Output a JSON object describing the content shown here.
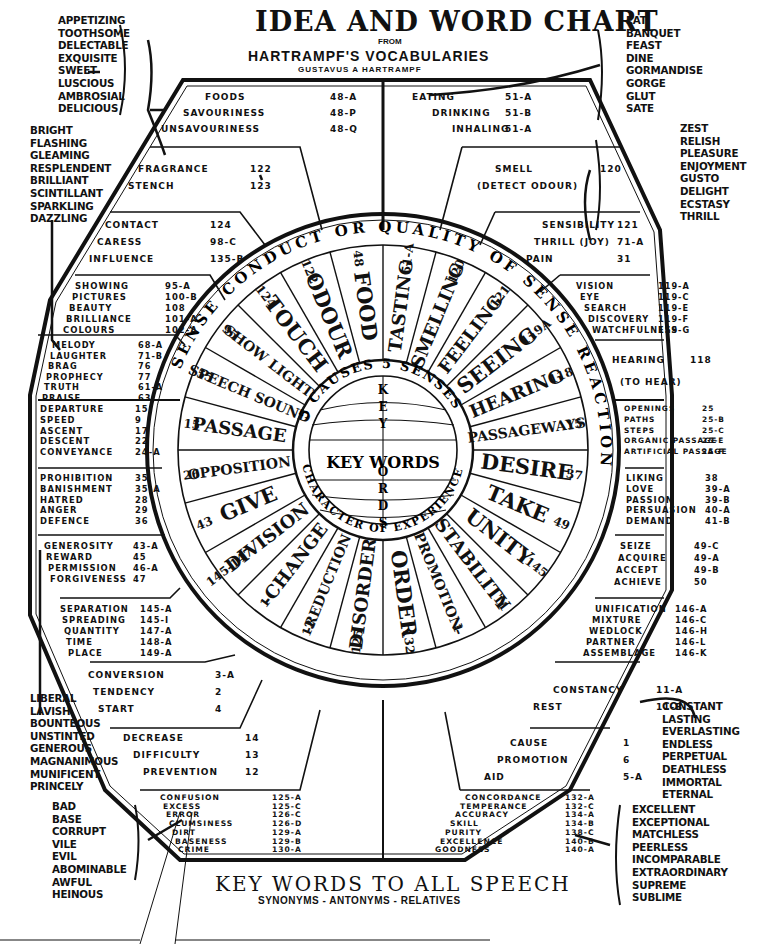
{
  "header": {
    "title": "IDEA AND WORD CHART",
    "from": "FROM",
    "subtitle": "HARTRAMPF'S  VOCABULARIES",
    "author": "GUSTAVUS A HARTRAMPF"
  },
  "footer": {
    "title": "KEY WORDS TO ALL SPEECH",
    "subtitle": "SYNONYMS - ANTONYMS - RELATIVES"
  },
  "side_lists": {
    "taste": [
      "APPETIZING",
      "TOOTHSOME",
      "DELECTABLE",
      "EXQUISITE",
      "SWEET",
      "LUSCIOUS",
      "AMBROSIAL",
      "DELICIOUS"
    ],
    "bright": [
      "BRIGHT",
      "FLASHING",
      "GLEAMING",
      "RESPLENDENT",
      "BRILLIANT",
      "SCINTILLANT",
      "SPARKLING",
      "DAZZLING"
    ],
    "eat": [
      "EAT",
      "BANQUET",
      "FEAST",
      "DINE",
      "GORMANDISE",
      "GORGE",
      "GLUT",
      "SATE"
    ],
    "zest": [
      "ZEST",
      "RELISH",
      "PLEASURE",
      "ENJOYMENT",
      "GUSTO",
      "DELIGHT",
      "ECSTASY",
      "THRILL"
    ],
    "liberal": [
      "LIBERAL",
      "LAVISH",
      "BOUNTEOUS",
      "UNSTINTED",
      "GENEROUS",
      "MAGNANIMOUS",
      "MUNIFICENT",
      "PRINCELY"
    ],
    "bad": [
      "BAD",
      "BASE",
      "CORRUPT",
      "VILE",
      "EVIL",
      "ABOMINABLE",
      "AWFUL",
      "HEINOUS"
    ],
    "constant": [
      "CONSTANT",
      "LASTING",
      "EVERLASTING",
      "ENDLESS",
      "PERPETUAL",
      "DEATHLESS",
      "IMMORTAL",
      "ETERNAL"
    ],
    "excellent": [
      "EXCELLENT",
      "EXCEPTIONAL",
      "MATCHLESS",
      "PEERLESS",
      "INCOMPARABLE",
      "EXTRAORDINARY",
      "SUPREME",
      "SUBLIME"
    ]
  },
  "sections": {
    "foods": [
      {
        "w": "FOODS",
        "n": "48-A"
      },
      {
        "w": "SAVOURINESS",
        "n": "48-P"
      },
      {
        "w": "UNSAVOURINESS",
        "n": "48-Q"
      }
    ],
    "eating": [
      {
        "w": "EATING",
        "n": "51-A"
      },
      {
        "w": "DRINKING",
        "n": "51-B"
      },
      {
        "w": "INHALING",
        "n": "51-A"
      }
    ],
    "fragrance": [
      {
        "w": "FRAGRANCE",
        "n": "122"
      },
      {
        "w": "STENCH",
        "n": "123"
      }
    ],
    "smell": [
      {
        "w": "SMELL",
        "n": "120"
      },
      {
        "w": "(DETECT ODOUR)",
        "n": ""
      }
    ],
    "contact": [
      {
        "w": "CONTACT",
        "n": "124"
      },
      {
        "w": "CARESS",
        "n": "98-C"
      },
      {
        "w": "INFLUENCE",
        "n": "135-B"
      }
    ],
    "sensibility": [
      {
        "w": "SENSIBILITY",
        "n": "121"
      },
      {
        "w": "THRILL (JOY)",
        "n": "71-A"
      },
      {
        "w": "PAIN",
        "n": "31"
      }
    ],
    "showing": [
      {
        "w": "SHOWING",
        "n": "95-A"
      },
      {
        "w": "PICTURES",
        "n": "100-B"
      },
      {
        "w": "BEAUTY",
        "n": "108"
      },
      {
        "w": "BRILLIANCE",
        "n": "101-A"
      },
      {
        "w": "COLOURS",
        "n": "102-A"
      }
    ],
    "vision": [
      {
        "w": "VISION",
        "n": "119-A"
      },
      {
        "w": "EYE",
        "n": "119-C"
      },
      {
        "w": "SEARCH",
        "n": "119-E"
      },
      {
        "w": "DISCOVERY",
        "n": "119-F"
      },
      {
        "w": "WATCHFULNESS",
        "n": "119-G"
      }
    ],
    "melody": [
      {
        "w": "MELODY",
        "n": "68-A"
      },
      {
        "w": "LAUGHTER",
        "n": "71-B"
      },
      {
        "w": "BRAG",
        "n": "76"
      },
      {
        "w": "PROPHECY",
        "n": "77"
      },
      {
        "w": "TRUTH",
        "n": "61-A"
      },
      {
        "w": "PRAISE",
        "n": "63"
      }
    ],
    "hearing": [
      {
        "w": "HEARING",
        "n": "118"
      },
      {
        "w": "(TO HEAR)",
        "n": ""
      }
    ],
    "departure": [
      {
        "w": "DEPARTURE",
        "n": "15"
      },
      {
        "w": "SPEED",
        "n": "9"
      },
      {
        "w": "ASCENT",
        "n": "17"
      },
      {
        "w": "DESCENT",
        "n": "22"
      },
      {
        "w": "CONVEYANCE",
        "n": "24-A"
      }
    ],
    "openings": [
      {
        "w": "OPENINGS",
        "n": "25"
      },
      {
        "w": "PATHS",
        "n": "25-B"
      },
      {
        "w": "STEPS",
        "n": "25-C"
      },
      {
        "w": "ORGANIC PASSAGE",
        "n": "25-E"
      },
      {
        "w": "ARTIFICIAL PASSAGE",
        "n": "25-F"
      }
    ],
    "prohibition": [
      {
        "w": "PROHIBITION",
        "n": "35"
      },
      {
        "w": "BANISHMENT",
        "n": "35-A"
      },
      {
        "w": "HATRED",
        "n": "28"
      },
      {
        "w": "ANGER",
        "n": "29"
      },
      {
        "w": "DEFENCE",
        "n": "36"
      }
    ],
    "liking": [
      {
        "w": "LIKING",
        "n": "38"
      },
      {
        "w": "LOVE",
        "n": "39-A"
      },
      {
        "w": "PASSION",
        "n": "39-B"
      },
      {
        "w": "PERSUASION",
        "n": "40-A"
      },
      {
        "w": "DEMAND",
        "n": "41-B"
      }
    ],
    "generosity": [
      {
        "w": "GENEROSITY",
        "n": "43-A"
      },
      {
        "w": "REWARD",
        "n": "45"
      },
      {
        "w": "PERMISSION",
        "n": "46-A"
      },
      {
        "w": "FORGIVENESS",
        "n": "47"
      }
    ],
    "seize": [
      {
        "w": "SEIZE",
        "n": "49-C"
      },
      {
        "w": "ACQUIRE",
        "n": "49-A"
      },
      {
        "w": "ACCEPT",
        "n": "49-B"
      },
      {
        "w": "ACHIEVE",
        "n": "50"
      }
    ],
    "separation": [
      {
        "w": "SEPARATION",
        "n": "145-A"
      },
      {
        "w": "SPREADING",
        "n": "145-I"
      },
      {
        "w": "QUANTITY",
        "n": "147-A"
      },
      {
        "w": "TIME",
        "n": "148-A"
      },
      {
        "w": "PLACE",
        "n": "149-A"
      }
    ],
    "unification": [
      {
        "w": "UNIFICATION",
        "n": "146-A"
      },
      {
        "w": "MIXTURE",
        "n": "146-C"
      },
      {
        "w": "WEDLOCK",
        "n": "146-H"
      },
      {
        "w": "PARTNER",
        "n": "146-L"
      },
      {
        "w": "ASSEMBLAGE",
        "n": "146-K"
      }
    ],
    "conversion": [
      {
        "w": "CONVERSION",
        "n": "3-A"
      },
      {
        "w": "TENDENCY",
        "n": "2"
      },
      {
        "w": "START",
        "n": "4"
      }
    ],
    "constancy": [
      {
        "w": "CONSTANCY",
        "n": "11-A"
      },
      {
        "w": "REST",
        "n": "11-B"
      }
    ],
    "decrease": [
      {
        "w": "DECREASE",
        "n": "14"
      },
      {
        "w": "DIFFICULTY",
        "n": "13"
      },
      {
        "w": "PREVENTION",
        "n": "12"
      }
    ],
    "cause": [
      {
        "w": "CAUSE",
        "n": "1"
      },
      {
        "w": "PROMOTION",
        "n": "6"
      },
      {
        "w": "AID",
        "n": "5-A"
      }
    ],
    "confusion": [
      {
        "w": "CONFUSION",
        "n": "125-A"
      },
      {
        "w": "EXCESS",
        "n": "125-C"
      },
      {
        "w": "ERROR",
        "n": "126-C"
      },
      {
        "w": "CLUMSINESS",
        "n": "126-D"
      },
      {
        "w": "DIRT",
        "n": "129-A"
      },
      {
        "w": "BASENESS",
        "n": "129-B"
      },
      {
        "w": "CRIME",
        "n": "130-A"
      }
    ],
    "concordance": [
      {
        "w": "CONCORDANCE",
        "n": "132-A"
      },
      {
        "w": "TEMPERANCE",
        "n": "132-C"
      },
      {
        "w": "ACCURACY",
        "n": "134-A"
      },
      {
        "w": "SKILL",
        "n": "134-B"
      },
      {
        "w": "PURITY",
        "n": "138-C"
      },
      {
        "w": "EXCELLENCE",
        "n": "140-B"
      },
      {
        "w": "GOODNESS",
        "n": "140-A"
      }
    ]
  },
  "wheel": {
    "outer_ring": [
      "SENSE",
      "CONDUCT",
      "OR",
      "QUALITY",
      "OF",
      "SENSE",
      "REACTION"
    ],
    "outer_ring_numbers": [
      "15",
      "92",
      "43",
      "145-147",
      "110"
    ],
    "inner_ring": [
      "5 CAUSES",
      "5 SENSES",
      "CHARACTER OF EXPERIENCE"
    ],
    "center": "KEY WORDS",
    "center_vertical": "KEYWORDS",
    "sectors": [
      {
        "label": "FOOD",
        "num": "48"
      },
      {
        "label": "ODOUR",
        "num": "122"
      },
      {
        "label": "TOUCH",
        "num": "124"
      },
      {
        "label": "SHOW LIGHT",
        "num": "95"
      },
      {
        "label": "SPEECH SOUND",
        "num": "55"
      },
      {
        "label": "PASSAGE",
        "num": "15"
      },
      {
        "label": "OPPOSITION",
        "num": "26"
      },
      {
        "label": "GIVE",
        "num": "43"
      },
      {
        "label": "DIVISION",
        "num": "145-147"
      },
      {
        "label": "-CHANGE",
        "num": "1"
      },
      {
        "label": "-REDUCTION",
        "num": "12"
      },
      {
        "label": "DISORDER",
        "num": "125"
      },
      {
        "label": "ORDER",
        "num": "132"
      },
      {
        "label": "PROMOTION-",
        "num": "1"
      },
      {
        "label": "STABILITY",
        "num": "11"
      },
      {
        "label": "UNITY",
        "num": "145"
      },
      {
        "label": "TAKE",
        "num": "49"
      },
      {
        "label": "DESIRE",
        "num": "37"
      },
      {
        "label": "PASSAGEWAYS",
        "num": "15"
      },
      {
        "label": "HEARING",
        "num": "118"
      },
      {
        "label": "SEEING",
        "num": "119A"
      },
      {
        "label": "FEELING",
        "num": "121"
      },
      {
        "label": "SMELLING",
        "num": "120"
      },
      {
        "label": "TASTING",
        "num": "51-A"
      }
    ]
  },
  "colors": {
    "ink": "#111111",
    "paper": "#ffffff"
  }
}
